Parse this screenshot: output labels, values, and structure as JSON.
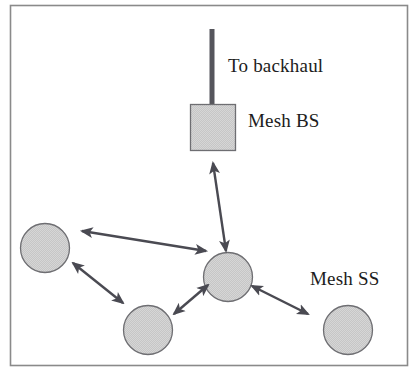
{
  "figure": {
    "type": "network-topology-diagram",
    "title": "",
    "frame": {
      "x": 10,
      "y": 5,
      "width": 398,
      "height": 361,
      "stroke": "#8a8a8a",
      "stroke_width": 1.5,
      "fill": "#ffffff"
    },
    "palette": {
      "node_fill": "#c6c6c6",
      "node_stroke": "#6e6e72",
      "arrow": "#4a4a52",
      "antenna": "#55555c",
      "text": "#1c1c20",
      "background": "#ffffff"
    }
  },
  "labels": {
    "backhaul": "To backhaul",
    "mesh_bs": "Mesh BS",
    "mesh_ss": "Mesh SS"
  },
  "nodes": [
    {
      "id": "mesh-bs",
      "kind": "square",
      "label_ref": "mesh_bs",
      "x": 190,
      "y": 104,
      "width": 46,
      "height": 47
    },
    {
      "id": "mesh-ss-hub",
      "kind": "circle",
      "label_ref": null,
      "cx": 228,
      "cy": 277,
      "r": 25
    },
    {
      "id": "mesh-ss-left",
      "kind": "circle",
      "label_ref": null,
      "cx": 45,
      "cy": 248,
      "r": 25
    },
    {
      "id": "mesh-ss-bottom",
      "kind": "circle",
      "label_ref": null,
      "cx": 148,
      "cy": 330,
      "r": 25
    },
    {
      "id": "mesh-ss-right",
      "kind": "circle",
      "label_ref": "mesh_ss",
      "cx": 348,
      "cy": 330,
      "r": 25
    }
  ],
  "antenna": {
    "x": 212,
    "y_top": 29,
    "y_bottom": 107,
    "width": 5
  },
  "links": [
    {
      "id": "link-bs-hub",
      "from": "mesh-bs",
      "to": "mesh-ss-hub",
      "x1": 213,
      "y1": 163,
      "x2": 226,
      "y2": 251,
      "arrows": "both"
    },
    {
      "id": "link-left-hub",
      "from": "mesh-ss-left",
      "to": "mesh-ss-hub",
      "x1": 82,
      "y1": 231,
      "x2": 206,
      "y2": 251,
      "arrows": "both"
    },
    {
      "id": "link-left-bottom",
      "from": "mesh-ss-left",
      "to": "mesh-ss-bottom",
      "x1": 73,
      "y1": 263,
      "x2": 123,
      "y2": 303,
      "arrows": "both"
    },
    {
      "id": "link-bottom-hub",
      "from": "mesh-ss-bottom",
      "to": "mesh-ss-hub",
      "x1": 174,
      "y1": 314,
      "x2": 208,
      "y2": 285,
      "arrows": "both"
    },
    {
      "id": "link-hub-right",
      "from": "mesh-ss-hub",
      "to": "mesh-ss-right",
      "x1": 252,
      "y1": 286,
      "x2": 308,
      "y2": 314,
      "arrows": "both"
    }
  ]
}
